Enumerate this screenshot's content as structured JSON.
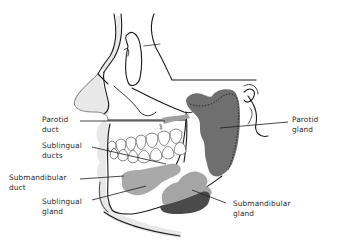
{
  "diagram": {
    "colors": {
      "outline": "#1a1a1a",
      "skin_fill": "#e6e6e6",
      "parotid_gland": "#6f6f6f",
      "sublingual_gland": "#a9a9a9",
      "submandibular_gland_light": "#a5a5a5",
      "submandibular_gland_dark": "#4a4a4a",
      "background": "#ffffff"
    },
    "labels": {
      "parotid_duct": "Parotid\nduct",
      "sublingual_ducts": "Sublingual\nducts",
      "submandibular_duct": "Submandibular\nduct",
      "sublingual_gland": "Sublingual\ngland",
      "parotid_gland": "Parotid\ngland",
      "submandibular_gland": "Submandibular\ngland"
    },
    "nodes": [
      {
        "id": "parotid_gland",
        "label": "Parotid gland",
        "side": "right"
      },
      {
        "id": "parotid_duct",
        "label": "Parotid duct",
        "side": "left"
      },
      {
        "id": "sublingual_ducts",
        "label": "Sublingual ducts",
        "side": "left"
      },
      {
        "id": "submandibular_duct",
        "label": "Submandibular duct",
        "side": "left"
      },
      {
        "id": "sublingual_gland",
        "label": "Sublingual gland",
        "side": "left"
      },
      {
        "id": "submandibular_gland",
        "label": "Submandibular gland",
        "side": "right"
      }
    ]
  }
}
